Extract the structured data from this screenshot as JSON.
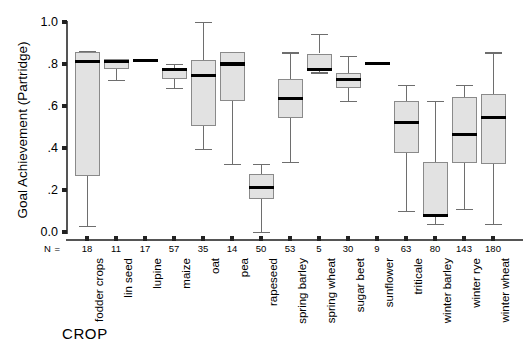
{
  "chart_data": {
    "type": "box",
    "title": "",
    "xlabel": "CROP",
    "ylabel": "Goal Achievement (Partridge)",
    "ylim": [
      0.0,
      1.0
    ],
    "ytick_labels": [
      "0.0",
      ".2",
      ".4",
      ".6",
      ".8",
      "1.0"
    ],
    "ytick_values": [
      0.0,
      0.2,
      0.4,
      0.6,
      0.8,
      1.0
    ],
    "grid": false,
    "legend": null,
    "n_row_label": "N =",
    "categories": [
      "fodder crops",
      "lin seed",
      "lupine",
      "maize",
      "oat",
      "pea",
      "rapeseed",
      "spring barley",
      "spring wheat",
      "sugar beet",
      "sunflower",
      "triticale",
      "winter barley",
      "winter rye",
      "winter wheat"
    ],
    "n_values": [
      18,
      11,
      17,
      57,
      35,
      14,
      50,
      53,
      5,
      30,
      9,
      63,
      80,
      143,
      180
    ],
    "boxes": [
      {
        "category": "fodder crops",
        "whisker_low": 0.03,
        "q1": 0.265,
        "median": 0.81,
        "q3": 0.855,
        "whisker_high": 0.86
      },
      {
        "category": "lin seed",
        "whisker_low": 0.725,
        "q1": 0.775,
        "median": 0.81,
        "q3": 0.825,
        "whisker_high": 0.825
      },
      {
        "category": "lupine",
        "whisker_low": 0.815,
        "q1": 0.815,
        "median": 0.815,
        "q3": 0.818,
        "whisker_high": 0.818
      },
      {
        "category": "maize",
        "whisker_low": 0.685,
        "q1": 0.73,
        "median": 0.775,
        "q3": 0.782,
        "whisker_high": 0.8
      },
      {
        "category": "oat",
        "whisker_low": 0.395,
        "q1": 0.505,
        "median": 0.745,
        "q3": 0.82,
        "whisker_high": 1.0
      },
      {
        "category": "pea",
        "whisker_low": 0.325,
        "q1": 0.625,
        "median": 0.8,
        "q3": 0.855,
        "whisker_high": 0.855
      },
      {
        "category": "rapeseed",
        "whisker_low": 0.0,
        "q1": 0.155,
        "median": 0.21,
        "q3": 0.275,
        "whisker_high": 0.325
      },
      {
        "category": "spring barley",
        "whisker_low": 0.335,
        "q1": 0.545,
        "median": 0.635,
        "q3": 0.73,
        "whisker_high": 0.855
      },
      {
        "category": "spring wheat",
        "whisker_low": 0.76,
        "q1": 0.765,
        "median": 0.775,
        "q3": 0.85,
        "whisker_high": 0.945
      },
      {
        "category": "sugar beet",
        "whisker_low": 0.625,
        "q1": 0.685,
        "median": 0.725,
        "q3": 0.755,
        "whisker_high": 0.84
      },
      {
        "category": "sunflower",
        "whisker_low": 0.8,
        "q1": 0.8,
        "median": 0.803,
        "q3": 0.808,
        "whisker_high": 0.808
      },
      {
        "category": "triticale",
        "whisker_low": 0.1,
        "q1": 0.375,
        "median": 0.52,
        "q3": 0.625,
        "whisker_high": 0.7
      },
      {
        "category": "winter barley",
        "whisker_low": 0.04,
        "q1": 0.075,
        "median": 0.078,
        "q3": 0.335,
        "whisker_high": 0.625
      },
      {
        "category": "winter rye",
        "whisker_low": 0.11,
        "q1": 0.33,
        "median": 0.465,
        "q3": 0.645,
        "whisker_high": 0.7
      },
      {
        "category": "winter wheat",
        "whisker_low": 0.04,
        "q1": 0.325,
        "median": 0.545,
        "q3": 0.655,
        "whisker_high": 0.855
      }
    ],
    "colors": {
      "box_fill": "#e2e2e2",
      "box_stroke": "#8a8a8a",
      "median": "#000000",
      "whisker": "#6e6e6e",
      "axis": "#555555",
      "text": "#000000"
    }
  }
}
